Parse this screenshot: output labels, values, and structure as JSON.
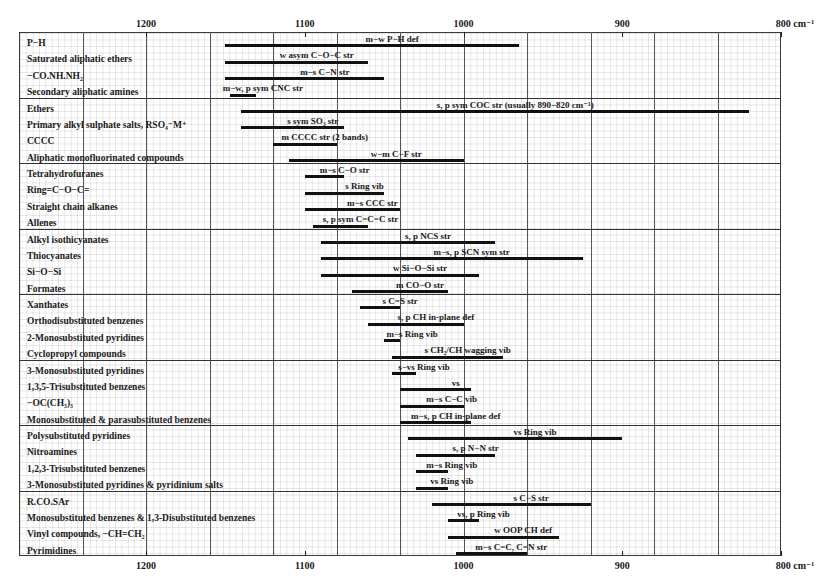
{
  "chart_data": {
    "type": "range-bar",
    "title": "",
    "xlabel": "cm⁻¹",
    "x_axis": {
      "reversed": true,
      "range": [
        1280,
        800
      ],
      "ticks": [
        1200,
        1100,
        1000,
        900,
        800
      ],
      "tick_labels": [
        "1200",
        "1100",
        "1000",
        "900",
        "800 cm⁻¹"
      ],
      "major_grid_step": 40
    },
    "grid": true,
    "groups": [
      [
        {
          "compound": "P−H",
          "assignment": "m−w P−H def",
          "from": 1150,
          "to": 965
        },
        {
          "compound": "Saturated aliphatic ethers",
          "assignment": "w asym C−O−C str",
          "from": 1150,
          "to": 1060
        },
        {
          "compound": "−CO.NH.NH₂",
          "assignment": "m−s C−N str",
          "from": 1150,
          "to": 1050
        },
        {
          "compound": "Secondary aliphatic amines",
          "assignment": "m−w, p sym CNC str",
          "from": 1147,
          "to": 1131
        }
      ],
      [
        {
          "compound": "Ethers",
          "assignment": "s, p sym COC str (usually 890−820 cm⁻¹)",
          "from": 1140,
          "to": 820
        },
        {
          "compound": "Primary alkyl sulphate salts, RSO₄⁻M⁺",
          "assignment": "s sym SO₃ str",
          "from": 1140,
          "to": 1075
        },
        {
          "compound": "CCCC",
          "assignment": "m CCCC str (2 bands)",
          "from": 1120,
          "to": 1080
        },
        {
          "compound": "Aliphatic monofluorinated compounds",
          "assignment": "w−m C−F str",
          "from": 1110,
          "to": 1000
        }
      ],
      [
        {
          "compound": "Tetrahydrofuranes",
          "assignment": "m−s C−O str",
          "from": 1100,
          "to": 1075
        },
        {
          "compound": "Ring=C−O−C=",
          "assignment": "s Ring vib",
          "from": 1100,
          "to": 1050
        },
        {
          "compound": "Straight chain alkanes",
          "assignment": "m−s CCC str",
          "from": 1100,
          "to": 1040
        },
        {
          "compound": "Allenes",
          "assignment": "s, p sym C=C=C str",
          "from": 1095,
          "to": 1060
        }
      ],
      [
        {
          "compound": "Alkyl isothicyanates",
          "assignment": "s, p NCS str",
          "from": 1090,
          "to": 980
        },
        {
          "compound": "Thiocyanates",
          "assignment": "m−s, p SCN sym str",
          "from": 1090,
          "to": 925
        },
        {
          "compound": "Si−O−Si",
          "assignment": "w Si−O−Si str",
          "from": 1090,
          "to": 990
        },
        {
          "compound": "Formates",
          "assignment": "m CO−O str",
          "from": 1070,
          "to": 1010
        }
      ],
      [
        {
          "compound": "Xanthates",
          "assignment": "s C=S str",
          "from": 1065,
          "to": 1040
        },
        {
          "compound": "Orthodisubstituted benzenes",
          "assignment": "s, p CH in-plane def",
          "from": 1060,
          "to": 1000
        },
        {
          "compound": "2-Monosubstituted pyridines",
          "assignment": "m−s Ring vib",
          "from": 1050,
          "to": 1040
        },
        {
          "compound": "Cyclopropyl compounds",
          "assignment": "s CH₂/CH wagging vib",
          "from": 1045,
          "to": 975
        }
      ],
      [
        {
          "compound": "3-Monosubstituted pyridines",
          "assignment": "s−vs Ring vib",
          "from": 1045,
          "to": 1030
        },
        {
          "compound": "1,3,5-Trisubstituted benzenes",
          "assignment": "vs",
          "from": 1040,
          "to": 995
        },
        {
          "compound": "−OC(CH₃)₃",
          "assignment": "m−s C−C vib",
          "from": 1040,
          "to": 1000
        },
        {
          "compound": "Monosubstituted & parasubstituted benzenes",
          "assignment": "m−s, p CH in-plane def",
          "from": 1040,
          "to": 995
        }
      ],
      [
        {
          "compound": "Polysubstituted pyridines",
          "assignment": "vs Ring vib",
          "from": 1035,
          "to": 900
        },
        {
          "compound": "Nitroamines",
          "assignment": "s, p N−N str",
          "from": 1030,
          "to": 980
        },
        {
          "compound": "1,2,3-Trisubstituted benzenes",
          "assignment": "m−s Ring vib",
          "from": 1030,
          "to": 1010
        },
        {
          "compound": "3-Monosubstituted pyridines & pyridinium salts",
          "assignment": "vs Ring vib",
          "from": 1030,
          "to": 1010
        }
      ],
      [
        {
          "compound": "R.CO.SAr",
          "assignment": "s C−S str",
          "from": 1020,
          "to": 920
        },
        {
          "compound": "Monosubstituted benzenes & 1,3-Disubstituted benzenes",
          "assignment": "vs, p Ring vib",
          "from": 1010,
          "to": 990
        },
        {
          "compound": "Vinyl compounds, −CH=CH₂",
          "assignment": "w OOP CH def",
          "from": 1010,
          "to": 940
        },
        {
          "compound": "Pyrimidines",
          "assignment": "m−s C=C, C=N str",
          "from": 1005,
          "to": 960
        }
      ]
    ]
  },
  "axis": {
    "top_labels": [
      "1200",
      "1100",
      "1000",
      "900",
      "800 cm⁻¹"
    ],
    "bottom_labels": [
      "1200",
      "1100",
      "1000",
      "900",
      "800 cm⁻¹"
    ]
  }
}
